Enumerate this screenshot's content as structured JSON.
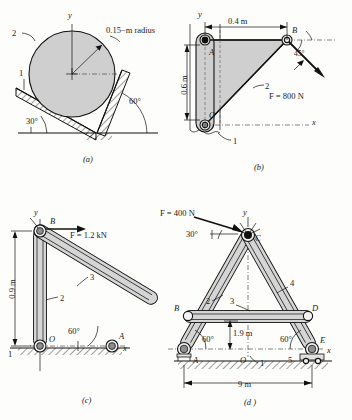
{
  "figure": {
    "panels": [
      "a",
      "b",
      "c",
      "d"
    ]
  },
  "panel_a": {
    "caption": "(a)",
    "axis_y": "y",
    "body_label": "2",
    "ground_label": "1",
    "radius_label": "0.15−m radius",
    "angle_left": "30°",
    "angle_right": "60°"
  },
  "panel_b": {
    "caption": "(b)",
    "axis_y": "y",
    "axis_x": "x",
    "dim_horizontal": "0.4 m",
    "dim_vertical": "0.6 m",
    "node_a": "A",
    "node_b": "B",
    "node_o": "O",
    "link_label": "2",
    "ground_label": "1",
    "angle": "45°",
    "force": "F = 800 N"
  },
  "panel_c": {
    "caption": "(c)",
    "axis_y": "y",
    "axis_x": "x",
    "dim_vertical": "0.9 m",
    "node_b": "B",
    "node_o": "O",
    "node_a": "A",
    "link_2": "2",
    "link_3": "3",
    "ground_label": "1",
    "angle": "60°",
    "force": "F = 1.2 kN"
  },
  "panel_d": {
    "caption": "(d )",
    "axis_y": "y",
    "axis_x": "x",
    "force": "F = 400 N",
    "force_angle": "30°",
    "node_a": "A",
    "node_b": "B",
    "node_c": "C",
    "node_d": "D",
    "node_e": "E",
    "node_o": "O",
    "link_1": "1",
    "link_2": "2",
    "link_3": "3",
    "link_4": "4",
    "link_5": "5",
    "angle_left": "60°",
    "angle_right": "60°",
    "dim_height": "1.9 m",
    "dim_span": "9 m"
  },
  "colors": {
    "ink": "#1a1a1a",
    "body_fill": "#cfcfcf",
    "bar_fill": "#d5d5d5",
    "paper": "#fdfdfb"
  }
}
